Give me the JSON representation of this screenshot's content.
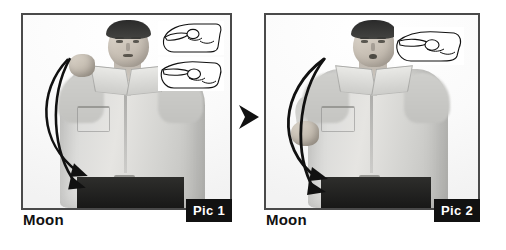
{
  "figure": {
    "type": "instructional-photo-sequence",
    "sign_word": "Moon",
    "background_color": "#ffffff",
    "step_separator_icon": "right-triangle-arrow-icon",
    "panels": [
      {
        "id": "pic-1",
        "caption": "Moon",
        "badge_label": "Pic 1",
        "badge_background": "#111111",
        "badge_text_color": "#ffffff",
        "border_color": "#4a4a4a",
        "photo_description": "Grayscale photo of a man in a light button-down shirt with dark trousers and belt, right fist raised beside his head",
        "motion_arrows": [
          {
            "name": "upper-curved-motion-arrow",
            "direction": "downward-curve-to-right"
          },
          {
            "name": "lower-curved-motion-arrow",
            "direction": "downward-curve-to-right"
          }
        ],
        "handshape_drawings": [
          {
            "name": "handshape-line-drawing-top",
            "description": "line drawing of hand, thumb and index forming small circle, fingers curled"
          },
          {
            "name": "handshape-line-drawing-bottom",
            "description": "line drawing of hand in profile, index finger extended with thumb circle"
          }
        ]
      },
      {
        "id": "pic-2",
        "caption": "Moon",
        "badge_label": "Pic 2",
        "badge_background": "#111111",
        "badge_text_color": "#ffffff",
        "border_color": "#4a4a4a",
        "photo_description": "Grayscale photo of the same man with lips rounded, hand lowered to waist height, crescent motion path traced",
        "motion_arrows": [
          {
            "name": "crescent-motion-arrow-outer",
            "direction": "arc-down-to-right"
          },
          {
            "name": "crescent-motion-arrow-inner",
            "direction": "arc-down-to-right"
          }
        ],
        "handshape_drawings": [
          {
            "name": "handshape-line-drawing",
            "description": "line drawing of hand in profile, index finger extended toward left"
          }
        ]
      }
    ]
  }
}
